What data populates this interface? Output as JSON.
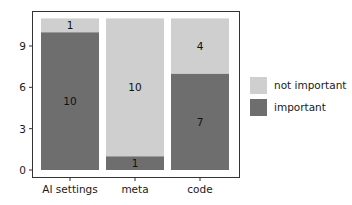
{
  "chart_data": {
    "type": "bar",
    "stacked": true,
    "title": "",
    "xlabel": "",
    "ylabel": "",
    "categories": [
      "AI settings",
      "meta",
      "code"
    ],
    "series": [
      {
        "name": "important",
        "values": [
          10,
          1,
          7
        ],
        "color": "#6e6e6e"
      },
      {
        "name": "not important",
        "values": [
          1,
          10,
          4
        ],
        "color": "#cfcfcf"
      }
    ],
    "yticks": [
      0,
      3,
      6,
      9
    ],
    "ylim": [
      -0.5,
      11.5
    ],
    "grid": false,
    "legend_position": "right",
    "legend_order": [
      "not important",
      "important"
    ]
  },
  "legend": {
    "items": [
      {
        "label": "not important",
        "color": "#cfcfcf"
      },
      {
        "label": "important",
        "color": "#6e6e6e"
      }
    ]
  }
}
